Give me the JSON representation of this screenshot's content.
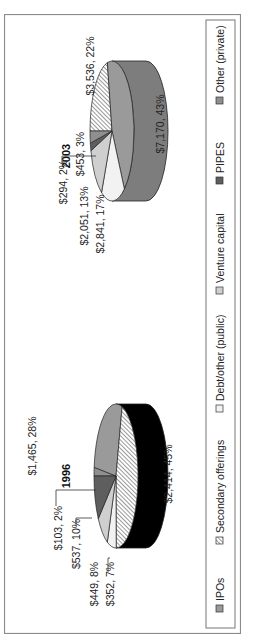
{
  "chart_data": {
    "type": "pie",
    "orientation": "rotated-90-ccw",
    "style": "3d-pie",
    "legend": {
      "placement": "bottom",
      "entries": [
        {
          "name": "IPOs",
          "color": "#9a9a9a",
          "pattern": "solid"
        },
        {
          "name": "Secondary offerings",
          "color": "#ffffff",
          "pattern": "diagonal-hatch"
        },
        {
          "name": "Debt/other (public)",
          "color": "#f2f2f2",
          "pattern": "solid"
        },
        {
          "name": "Venture capital",
          "color": "#cfcfcf",
          "pattern": "solid"
        },
        {
          "name": "PIPES",
          "color": "#5e5e5e",
          "pattern": "solid"
        },
        {
          "name": "Other (private)",
          "color": "#8f8f8f",
          "pattern": "solid"
        }
      ]
    },
    "pies": [
      {
        "title": "1996",
        "slices": [
          {
            "category": "IPOs",
            "value": 1465,
            "percent": 28,
            "label": "$1,465, 28%"
          },
          {
            "category": "Secondary offerings",
            "value": 2414,
            "percent": 45,
            "label": "$2,414, 45%"
          },
          {
            "category": "Debt/other (public)",
            "value": 352,
            "percent": 7,
            "label": "$352, 7%"
          },
          {
            "category": "Venture capital",
            "value": 449,
            "percent": 8,
            "label": "$449, 8%"
          },
          {
            "category": "PIPES",
            "value": 537,
            "percent": 10,
            "label": "$537, 10%"
          },
          {
            "category": "Other (private)",
            "value": 103,
            "percent": 2,
            "label": "$103, 2%"
          }
        ]
      },
      {
        "title": "2003",
        "slices": [
          {
            "category": "IPOs",
            "value": 7170,
            "percent": 43,
            "label": "$7,170, 43%"
          },
          {
            "category": "Secondary offerings",
            "value": 3536,
            "percent": 22,
            "label": "$3,536, 22%"
          },
          {
            "category": "Debt/other (public)",
            "value": 2841,
            "percent": 17,
            "label": "$2,841, 17%"
          },
          {
            "category": "Venture capital",
            "value": 2051,
            "percent": 13,
            "label": "$2,051, 13%"
          },
          {
            "category": "PIPES",
            "value": 294,
            "percent": 2,
            "label": "$294, 2%"
          },
          {
            "category": "Other (private)",
            "value": 453,
            "percent": 3,
            "label": "$453, 3%"
          }
        ]
      }
    ]
  }
}
